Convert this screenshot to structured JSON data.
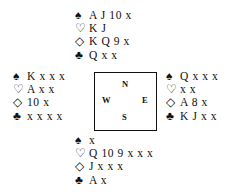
{
  "suit_symbols": {
    "spades": "♠",
    "hearts": "♡",
    "diamonds": "◇",
    "clubs": "♣"
  },
  "hands": {
    "north": {
      "spades": "A J 10 x",
      "hearts": "K J",
      "diamonds": "K Q 9 x",
      "clubs": "Q x x"
    },
    "west": {
      "spades": "K x x x",
      "hearts": "A x x",
      "diamonds": "10 x",
      "clubs": "x x x x"
    },
    "east": {
      "spades": "Q x x x",
      "hearts": "x x",
      "diamonds": "A 8 x",
      "clubs": "K J x x"
    },
    "south": {
      "spades": "x",
      "hearts": "Q 10 9 x x x",
      "diamonds": "J x x x",
      "clubs": "A x"
    }
  },
  "compass": {
    "n": "N",
    "w": "W",
    "e": "E",
    "s": "S"
  }
}
